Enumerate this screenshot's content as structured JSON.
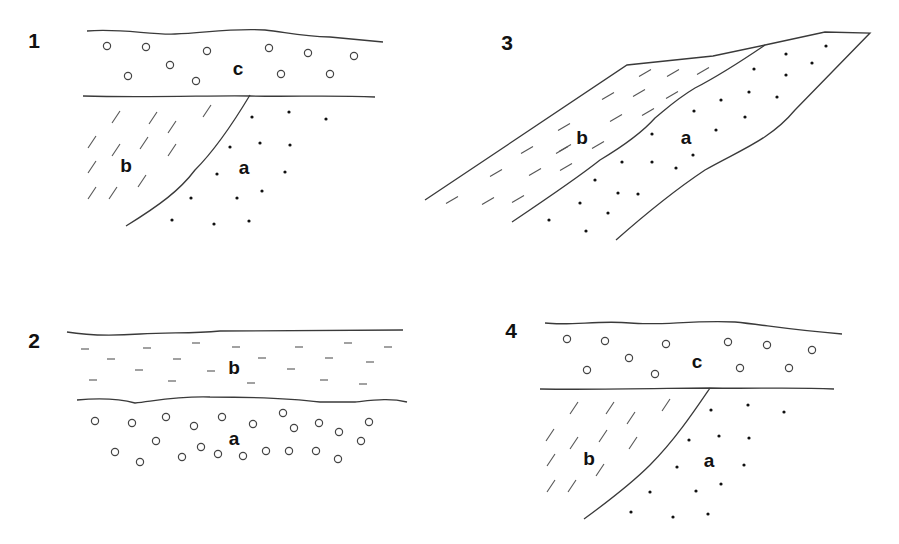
{
  "figure": {
    "panels": [
      {
        "id": "1",
        "number_label": "1",
        "number_pos": [
          34,
          48
        ],
        "lines": [
          "M87,31 C120,28 150,35 175,34 C205,33 230,28 265,30 C285,32 300,36 330,37 L383,42",
          "M83,96 C150,98 220,95 250,96 C290,97 330,95 375,97",
          "M250,95 C235,120 215,150 195,170 C180,190 160,205 126,226"
        ],
        "pebbles": [
          [
            107,
            46
          ],
          [
            146,
            47
          ],
          [
            207,
            51
          ],
          [
            269,
            48
          ],
          [
            308,
            53
          ],
          [
            354,
            56
          ],
          [
            128,
            76
          ],
          [
            170,
            65
          ],
          [
            196,
            81
          ],
          [
            281,
            74
          ],
          [
            330,
            74
          ]
        ],
        "sand": [
          [
            252,
            117
          ],
          [
            289,
            112
          ],
          [
            326,
            119
          ],
          [
            230,
            147
          ],
          [
            260,
            143
          ],
          [
            290,
            145
          ],
          [
            217,
            174
          ],
          [
            285,
            172
          ],
          [
            191,
            198
          ],
          [
            237,
            198
          ],
          [
            262,
            191
          ],
          [
            172,
            220
          ],
          [
            214,
            224
          ],
          [
            249,
            221
          ]
        ],
        "ticks": [
          [
            116,
            117
          ],
          [
            153,
            118
          ],
          [
            207,
            111
          ],
          [
            172,
            127
          ],
          [
            92,
            142
          ],
          [
            116,
            150
          ],
          [
            144,
            143
          ],
          [
            172,
            150
          ],
          [
            92,
            167
          ],
          [
            142,
            181
          ],
          [
            92,
            193
          ],
          [
            113,
            193
          ]
        ],
        "labels": [
          {
            "text": "c",
            "pos": [
              238,
              75
            ]
          },
          {
            "text": "b",
            "pos": [
              126,
              172
            ]
          },
          {
            "text": "a",
            "pos": [
              244,
              174
            ]
          }
        ]
      },
      {
        "id": "3",
        "number_label": "3",
        "number_pos": [
          507,
          50
        ],
        "lines": [
          "M425,200 L627,65 L713,56 L765,45 L825,32 L870,33 L795,110 C770,140 740,150 705,170 C675,190 650,210 616,240",
          "M765,45 C740,60 730,75 710,85 C690,95 670,100 650,115 C630,140 605,150 598,158 C580,170 560,180 520,200 L512,205 L513,205",
          "M765,45 L750,58 C735,72 720,78 708,85"
        ],
        "boundary_b_a": "M765,45 C740,62 720,75 695,88 C675,100 665,110 655,118 C640,135 620,148 600,160 C585,172 570,183 512,222",
        "sand": [
          [
            826,
            46
          ],
          [
            786,
            54
          ],
          [
            754,
            69
          ],
          [
            812,
            63
          ],
          [
            786,
            75
          ],
          [
            749,
            92
          ],
          [
            777,
            97
          ],
          [
            721,
            100
          ],
          [
            694,
            111
          ],
          [
            745,
            117
          ],
          [
            652,
            134
          ],
          [
            716,
            130
          ],
          [
            622,
            162
          ],
          [
            652,
            162
          ],
          [
            676,
            168
          ],
          [
            693,
            155
          ],
          [
            595,
            180
          ],
          [
            618,
            193
          ],
          [
            638,
            194
          ],
          [
            580,
            203
          ],
          [
            608,
            213
          ],
          [
            549,
            220
          ],
          [
            586,
            231
          ]
        ],
        "ticks": [
          [
            645,
            73
          ],
          [
            673,
            73
          ],
          [
            703,
            71
          ],
          [
            608,
            96
          ],
          [
            639,
            93
          ],
          [
            672,
            95
          ],
          [
            616,
            118
          ],
          [
            648,
            112
          ],
          [
            564,
            127
          ],
          [
            598,
            145
          ],
          [
            527,
            150
          ],
          [
            562,
            150
          ],
          [
            565,
            148
          ],
          [
            496,
            173
          ],
          [
            535,
            172
          ],
          [
            566,
            167
          ],
          [
            452,
            200
          ],
          [
            488,
            201
          ],
          [
            518,
            199
          ]
        ],
        "labels": [
          {
            "text": "b",
            "pos": [
              582,
              144
            ]
          },
          {
            "text": "a",
            "pos": [
              686,
              144
            ]
          }
        ]
      },
      {
        "id": "2",
        "number_label": "2",
        "number_pos": [
          34,
          348
        ],
        "lines": [
          "M67,332 C90,336 110,336 140,334 C170,332 190,334 220,331 L403,330",
          "M77,400 C100,398 120,399 135,403 C160,400 180,396 210,397 C250,397 290,398 320,402 L355,402 C375,400 390,398 407,402"
        ],
        "pebbles": [
          [
            95,
            421
          ],
          [
            132,
            423
          ],
          [
            166,
            417
          ],
          [
            194,
            426
          ],
          [
            222,
            417
          ],
          [
            253,
            424
          ],
          [
            283,
            413
          ],
          [
            294,
            428
          ],
          [
            319,
            423
          ],
          [
            339,
            432
          ],
          [
            369,
            422
          ],
          [
            156,
            441
          ],
          [
            115,
            452
          ],
          [
            140,
            462
          ],
          [
            182,
            457
          ],
          [
            201,
            447
          ],
          [
            218,
            454
          ],
          [
            243,
            456
          ],
          [
            266,
            451
          ],
          [
            289,
            451
          ],
          [
            316,
            451
          ],
          [
            338,
            459
          ],
          [
            361,
            441
          ]
        ],
        "dashes": [
          [
            85,
            349
          ],
          [
            147,
            348
          ],
          [
            196,
            343
          ],
          [
            236,
            347
          ],
          [
            299,
            347
          ],
          [
            348,
            343
          ],
          [
            388,
            347
          ],
          [
            111,
            359
          ],
          [
            177,
            359
          ],
          [
            262,
            358
          ],
          [
            329,
            358
          ],
          [
            370,
            362
          ],
          [
            139,
            370
          ],
          [
            211,
            371
          ],
          [
            291,
            369
          ],
          [
            93,
            380
          ],
          [
            172,
            381
          ],
          [
            251,
            383
          ],
          [
            324,
            380
          ],
          [
            363,
            384
          ]
        ],
        "labels": [
          {
            "text": "b",
            "pos": [
              234,
              374
            ]
          },
          {
            "text": "a",
            "pos": [
              234,
              445
            ]
          }
        ]
      },
      {
        "id": "4",
        "number_label": "4",
        "number_pos": [
          511,
          338
        ],
        "lines": [
          "M545,323 C570,326 600,320 630,323 C660,326 690,320 735,322 C765,325 790,330 842,334",
          "M540,389 C600,390 680,388 710,388 C750,389 790,387 834,389",
          "M710,388 C695,410 675,440 650,465 C635,480 610,500 584,519"
        ],
        "pebbles": [
          [
            567,
            339
          ],
          [
            605,
            341
          ],
          [
            666,
            344
          ],
          [
            728,
            342
          ],
          [
            767,
            345
          ],
          [
            812,
            350
          ],
          [
            587,
            370
          ],
          [
            629,
            358
          ],
          [
            655,
            374
          ],
          [
            740,
            368
          ],
          [
            789,
            368
          ]
        ],
        "sand": [
          [
            711,
            410
          ],
          [
            748,
            405
          ],
          [
            784,
            412
          ],
          [
            689,
            440
          ],
          [
            719,
            436
          ],
          [
            749,
            438
          ],
          [
            677,
            467
          ],
          [
            744,
            465
          ],
          [
            650,
            492
          ],
          [
            696,
            491
          ],
          [
            721,
            484
          ],
          [
            631,
            512
          ],
          [
            673,
            517
          ],
          [
            708,
            514
          ]
        ],
        "ticks": [
          [
            574,
            408
          ],
          [
            610,
            408
          ],
          [
            666,
            405
          ],
          [
            631,
            418
          ],
          [
            550,
            435
          ],
          [
            574,
            443
          ],
          [
            603,
            436
          ],
          [
            633,
            443
          ],
          [
            551,
            460
          ],
          [
            600,
            470
          ],
          [
            551,
            486
          ],
          [
            572,
            486
          ]
        ],
        "labels": [
          {
            "text": "c",
            "pos": [
              697,
              368
            ]
          },
          {
            "text": "b",
            "pos": [
              589,
              465
            ]
          },
          {
            "text": "a",
            "pos": [
              709,
              467
            ]
          }
        ]
      }
    ]
  }
}
